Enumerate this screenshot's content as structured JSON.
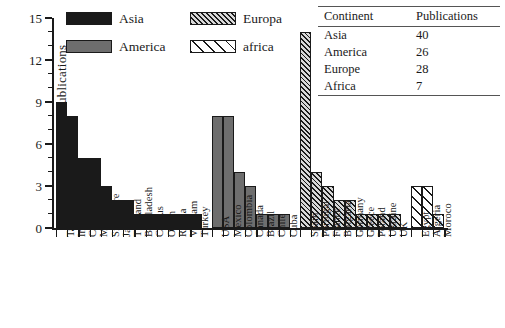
{
  "chart_data": {
    "type": "bar",
    "title": "",
    "xlabel": "",
    "ylabel": "Publications",
    "ylim": [
      0,
      15
    ],
    "ytick_labels": [
      "0",
      "3",
      "6",
      "9",
      "12",
      "15"
    ],
    "ytick_values": [
      0,
      3,
      6,
      9,
      12,
      15
    ],
    "minor_tick_step": 1,
    "grid": false,
    "legend_position": "top-left",
    "series": [
      {
        "name": "Asia",
        "color": "#1a1a1a",
        "pattern": "solid",
        "categories": [
          "Taiwan",
          "India",
          "China",
          "Malaysia",
          "Singapore",
          "Japan",
          "Thailand",
          "Bangladesh",
          "Cyprus",
          "Oman",
          "Russia",
          "Vietnam",
          "Turkey"
        ],
        "values": [
          9,
          8,
          5,
          5,
          3,
          2,
          2,
          1,
          1,
          1,
          1,
          1,
          1
        ]
      },
      {
        "name": "America",
        "color": "#6e6e6e",
        "pattern": "solid",
        "categories": [
          "USA",
          "Mexico",
          "Colombia",
          "Canada",
          "Brazil",
          "Chile",
          "Cuba"
        ],
        "values": [
          8,
          8,
          4,
          3,
          1,
          1,
          1
        ]
      },
      {
        "name": "Europa",
        "color": "#1a1a1a",
        "pattern": "dense-diagonal-hatch",
        "categories": [
          "Spain",
          "Portugal",
          "France",
          "Bulgaria",
          "Germany",
          "Greece",
          "Poland",
          "Ukraine",
          "UK"
        ],
        "values": [
          14,
          4,
          3,
          2,
          2,
          1,
          1,
          1,
          1
        ]
      },
      {
        "name": "africa",
        "color": "#1a1a1a",
        "pattern": "sparse-diagonal-hatch",
        "categories": [
          "Egypt",
          "Algeria",
          "Moroco"
        ],
        "values": [
          3,
          3,
          1
        ]
      }
    ]
  },
  "legend": {
    "items": [
      {
        "label": "Asia",
        "swatch": "asia"
      },
      {
        "label": "America",
        "swatch": "america"
      },
      {
        "label": "Europa",
        "swatch": "europe"
      },
      {
        "label": "africa",
        "swatch": "africa"
      }
    ]
  },
  "table": {
    "headers": [
      "Continent",
      "Publications"
    ],
    "rows": [
      {
        "continent": "Asia",
        "publications": "40"
      },
      {
        "continent": "America",
        "publications": "26"
      },
      {
        "continent": "Europe",
        "publications": "28"
      },
      {
        "continent": "Africa",
        "publications": "7"
      }
    ]
  }
}
